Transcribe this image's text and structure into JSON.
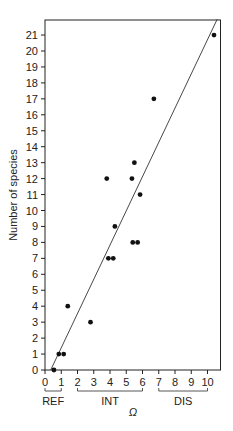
{
  "chart_data": {
    "type": "scatter",
    "title": "",
    "xlabel": "Ω",
    "ylabel": "Number of species",
    "xlim": [
      0,
      10.8
    ],
    "ylim": [
      0,
      22
    ],
    "x_ticks": [
      0,
      1,
      2,
      3,
      4,
      5,
      6,
      7,
      8,
      9,
      10
    ],
    "y_ticks": [
      0,
      1,
      2,
      3,
      4,
      5,
      6,
      7,
      8,
      9,
      10,
      11,
      12,
      13,
      14,
      15,
      16,
      17,
      18,
      19,
      20,
      21
    ],
    "grid": false,
    "legend": null,
    "points": [
      {
        "x": 0.55,
        "y": 0
      },
      {
        "x": 0.85,
        "y": 1
      },
      {
        "x": 1.15,
        "y": 1
      },
      {
        "x": 1.4,
        "y": 4
      },
      {
        "x": 2.8,
        "y": 3
      },
      {
        "x": 3.9,
        "y": 7
      },
      {
        "x": 4.2,
        "y": 7
      },
      {
        "x": 4.3,
        "y": 9
      },
      {
        "x": 3.8,
        "y": 12
      },
      {
        "x": 5.35,
        "y": 12
      },
      {
        "x": 5.5,
        "y": 13
      },
      {
        "x": 5.85,
        "y": 11
      },
      {
        "x": 5.4,
        "y": 8
      },
      {
        "x": 5.7,
        "y": 8
      },
      {
        "x": 6.7,
        "y": 17
      },
      {
        "x": 10.4,
        "y": 21
      }
    ],
    "fit_line": {
      "x1": 0.35,
      "y1": 0,
      "x2": 10.6,
      "y2": 22
    },
    "groups": [
      {
        "label": "REF",
        "from": 0,
        "to": 1
      },
      {
        "label": "INT",
        "from": 2,
        "to": 6
      },
      {
        "label": "DIS",
        "from": 7,
        "to": 10
      }
    ]
  }
}
